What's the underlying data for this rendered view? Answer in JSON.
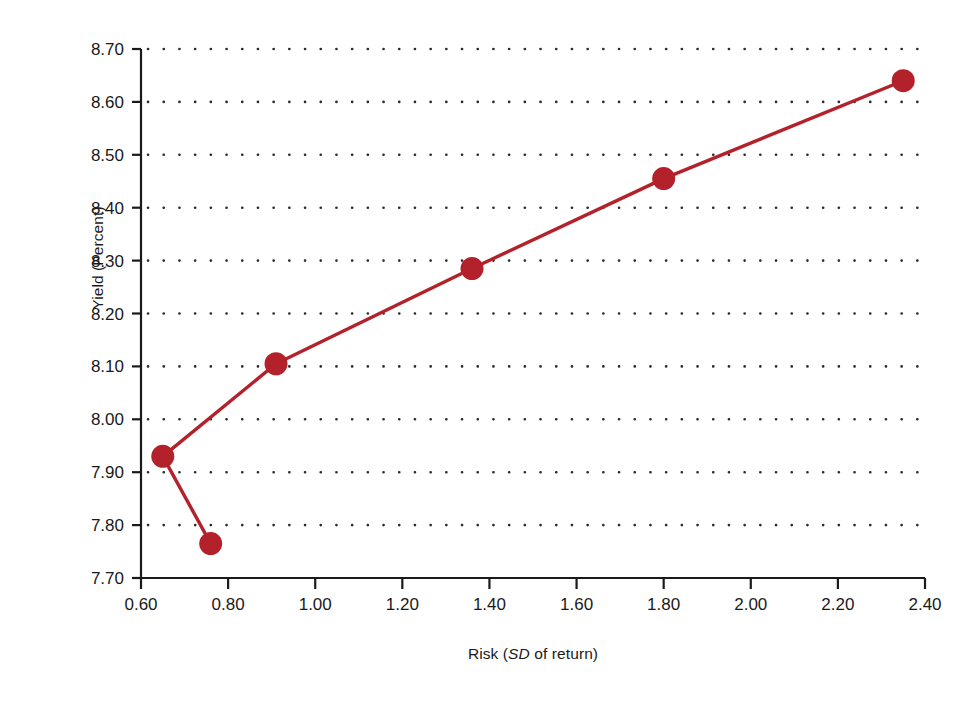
{
  "chart_data": {
    "type": "line",
    "title": "",
    "xlabel_plain": "Risk (SD of return)",
    "xlabel_parts": {
      "before": "Risk (",
      "italic": "SD",
      "after": " of return)"
    },
    "ylabel": "Yield (Percent)",
    "xlim": [
      0.6,
      2.4
    ],
    "ylim": [
      7.7,
      8.7
    ],
    "xticks": [
      "0.60",
      "0.80",
      "1.00",
      "1.20",
      "1.40",
      "1.60",
      "1.80",
      "2.00",
      "2.20",
      "2.40"
    ],
    "yticks": [
      "7.70",
      "7.80",
      "7.90",
      "8.00",
      "8.10",
      "8.20",
      "8.30",
      "8.40",
      "8.50",
      "8.60",
      "8.70"
    ],
    "grid": "horizontal-dotted",
    "legend": "none",
    "series": [
      {
        "name": "Efficient frontier",
        "color": "#b3222a",
        "marker": "filled-circle",
        "x": [
          0.65,
          0.76,
          0.91,
          1.36,
          1.8,
          2.35
        ],
        "y": [
          7.93,
          7.765,
          8.105,
          8.285,
          8.455,
          8.64
        ],
        "draw_order": [
          1,
          0,
          2,
          3,
          4,
          5
        ]
      }
    ]
  },
  "axes": {
    "line_color": "#1a1a1a",
    "grid_dot_color": "#2b2b2b"
  }
}
